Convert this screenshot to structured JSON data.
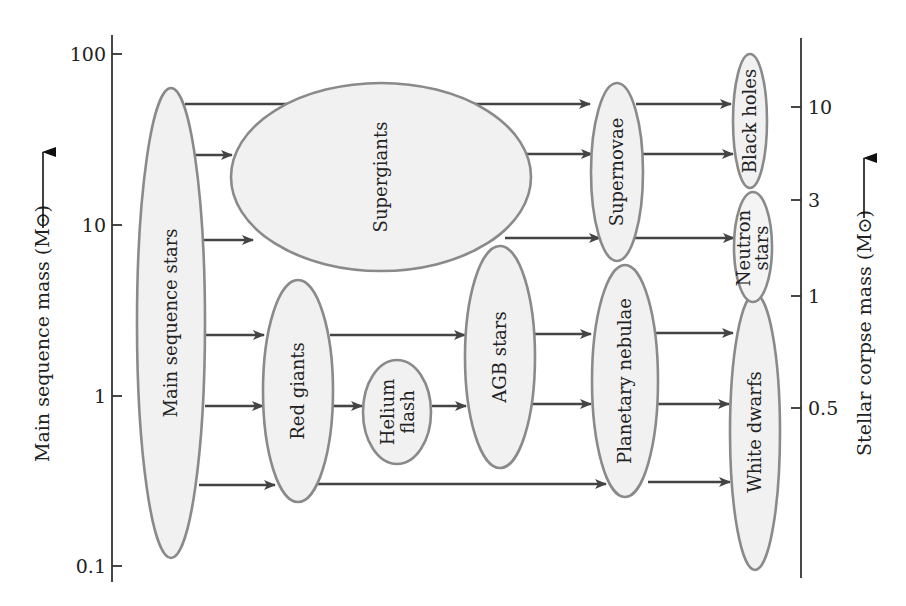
{
  "diagram": {
    "left_axis": {
      "title": "Main sequence mass (M⊙)",
      "ticks": [
        {
          "label": "100",
          "y": 54
        },
        {
          "label": "10",
          "y": 225
        },
        {
          "label": "1",
          "y": 396
        },
        {
          "label": "0.1",
          "y": 566
        }
      ]
    },
    "right_axis": {
      "title": "Stellar corpse mass (M⊙)",
      "ticks": [
        {
          "label": "10",
          "y": 107
        },
        {
          "label": "3",
          "y": 200
        },
        {
          "label": "1",
          "y": 296
        },
        {
          "label": "0.5",
          "y": 408
        }
      ]
    },
    "nodes": [
      {
        "id": "main_sequence",
        "label": "Main sequence stars"
      },
      {
        "id": "supergiants",
        "label": "Supergiants"
      },
      {
        "id": "red_giants",
        "label": "Red giants"
      },
      {
        "id": "helium_flash",
        "label_line1": "Helium",
        "label_line2": "flash"
      },
      {
        "id": "agb_stars",
        "label": "AGB stars"
      },
      {
        "id": "supernovae",
        "label": "Supernovae"
      },
      {
        "id": "planetary_nebulae",
        "label": "Planetary nebulae"
      },
      {
        "id": "black_holes",
        "label": "Black holes"
      },
      {
        "id": "neutron_stars",
        "label_line1": "Neutron",
        "label_line2": "stars"
      },
      {
        "id": "white_dwarfs",
        "label": "White dwarfs"
      }
    ],
    "edges": [
      {
        "from": "Main sequence stars",
        "to": "Supernovae"
      },
      {
        "from": "Main sequence stars",
        "to": "Supergiants"
      },
      {
        "from": "Main sequence stars",
        "to": "Supergiants"
      },
      {
        "from": "Main sequence stars",
        "to": "Red giants"
      },
      {
        "from": "Main sequence stars",
        "to": "Red giants"
      },
      {
        "from": "Main sequence stars",
        "to": "Red giants"
      },
      {
        "from": "Supergiants",
        "to": "Supernovae"
      },
      {
        "from": "Supergiants",
        "to": "Supernovae"
      },
      {
        "from": "Red giants",
        "to": "AGB stars"
      },
      {
        "from": "Red giants",
        "to": "Helium flash"
      },
      {
        "from": "Helium flash",
        "to": "AGB stars"
      },
      {
        "from": "Red giants",
        "to": "Planetary nebulae"
      },
      {
        "from": "AGB stars",
        "to": "Planetary nebulae"
      },
      {
        "from": "AGB stars",
        "to": "Planetary nebulae"
      },
      {
        "from": "Supernovae",
        "to": "Black holes"
      },
      {
        "from": "Supernovae",
        "to": "Black holes"
      },
      {
        "from": "Supernovae",
        "to": "Neutron stars"
      },
      {
        "from": "Planetary nebulae",
        "to": "White dwarfs"
      },
      {
        "from": "Planetary nebulae",
        "to": "White dwarfs"
      },
      {
        "from": "Planetary nebulae",
        "to": "White dwarfs"
      }
    ],
    "colors": {
      "node_fill": "#f1f1f1",
      "node_stroke": "#8a8a8a",
      "arrow": "#444444",
      "axis": "#333333",
      "text": "#222222"
    }
  }
}
